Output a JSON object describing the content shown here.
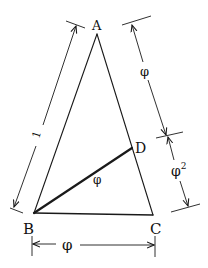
{
  "diagram": {
    "type": "golden-triangle",
    "colors": {
      "stroke": "#1a1a1a",
      "background": "#ffffff"
    },
    "vertices": {
      "A": {
        "label": "A"
      },
      "B": {
        "label": "B"
      },
      "C": {
        "label": "C"
      },
      "D": {
        "label": "D"
      }
    },
    "segment_labels": {
      "BD": "φ"
    },
    "dimensions": {
      "AB": "1",
      "AD": "φ",
      "DC": "φ²",
      "BC": "φ"
    },
    "phi_symbol": "φ",
    "superscript_two": "2"
  }
}
